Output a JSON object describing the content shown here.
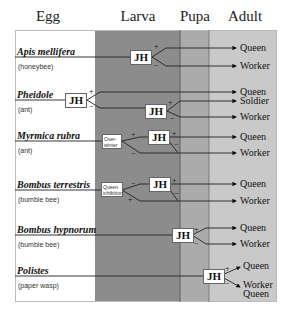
{
  "headers": {
    "egg": "Egg",
    "larva": "Larva",
    "pupa": "Pupa",
    "adult": "Adult"
  },
  "colors": {
    "larva": "#8c8c8c",
    "pupa": "#ababab",
    "adult": "#c9c9c9",
    "egg": "#ffffff"
  },
  "species": [
    {
      "name": "Apis mellifera",
      "common": "(honeybee)",
      "outcomes": [
        "Queen",
        "Worker"
      ]
    },
    {
      "name": "Pheidole",
      "common": "(ant)",
      "outcomes": [
        "Queen",
        "Soldier",
        "Worker"
      ]
    },
    {
      "name": "Myrmica rubra",
      "common": "(ant)",
      "modifier": "Over-winter",
      "outcomes": [
        "Queen",
        "Worker"
      ]
    },
    {
      "name": "Bombus terrestris",
      "common": "(bumble bee)",
      "modifier": "Queen inhibition",
      "outcomes": [
        "Queen",
        "Worker"
      ]
    },
    {
      "name": "Bombus hypnorum",
      "common": "(bumble bee)",
      "outcomes": [
        "Queen",
        "Worker"
      ]
    },
    {
      "name": "Polistes",
      "common": "(paper wasp)",
      "outcomes": [
        "Queen",
        "Worker",
        "Queen"
      ]
    }
  ],
  "hormone_label": "JH",
  "signs": {
    "plus": "+",
    "minus": "−"
  }
}
